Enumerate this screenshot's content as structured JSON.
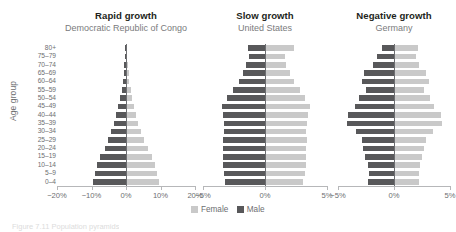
{
  "axis": {
    "y_label": "Age group",
    "age_groups": [
      "80+",
      "75–79",
      "70–74",
      "65–69",
      "60–64",
      "55–59",
      "50–54",
      "45–49",
      "40–44",
      "35–39",
      "30–34",
      "25–29",
      "20–24",
      "15–19",
      "10–14",
      "5–9",
      "0–4"
    ]
  },
  "legend": {
    "female_label": "Female",
    "male_label": "Male",
    "female_color": "#c9c9c9",
    "male_color": "#58585a"
  },
  "caption": {
    "text": "Figure 7.11 Population pyramids"
  },
  "panels": [
    {
      "title": "Rapid growth",
      "subtitle": "Democratic Republic of Congo",
      "ticks": [
        "−20%",
        "−10%",
        "0%",
        "10%",
        "20%"
      ]
    },
    {
      "title": "Slow growth",
      "subtitle": "United States",
      "ticks": [
        "−5%",
        "0%",
        "5%"
      ]
    },
    {
      "title": "Negative growth",
      "subtitle": "Germany",
      "ticks": [
        "−5%",
        "0%",
        "5%"
      ]
    }
  ],
  "chart_data": {
    "type": "bar",
    "title": "Population pyramids",
    "xlabel": "Percent of population",
    "ylabel": "Age group",
    "grid": false,
    "legend_position": "bottom-center",
    "categories": [
      "80+",
      "75–79",
      "70–74",
      "65–69",
      "60–64",
      "55–59",
      "50–54",
      "45–49",
      "40–44",
      "35–39",
      "30–34",
      "25–29",
      "20–24",
      "15–19",
      "10–14",
      "5–9",
      "0–4"
    ],
    "panels": [
      {
        "name": "Rapid growth",
        "subtitle": "Democratic Republic of Congo",
        "xlim": [
          -20,
          20
        ],
        "xticks": [
          -20,
          -10,
          0,
          10,
          20
        ],
        "series": [
          {
            "name": "Male",
            "values": [
              0.25,
              0.35,
              0.5,
              0.7,
              0.95,
              1.3,
              1.7,
              2.2,
              2.8,
              3.5,
              4.3,
              5.2,
              6.2,
              7.4,
              8.4,
              9.0,
              9.6
            ]
          },
          {
            "name": "Female",
            "values": [
              0.3,
              0.4,
              0.55,
              0.75,
              1.0,
              1.35,
              1.75,
              2.25,
              2.85,
              3.55,
              4.35,
              5.3,
              6.3,
              7.5,
              8.5,
              9.1,
              9.7
            ]
          }
        ]
      },
      {
        "name": "Slow growth",
        "subtitle": "United States",
        "xlim": [
          -5,
          5
        ],
        "xticks": [
          -5,
          0,
          5
        ],
        "series": [
          {
            "name": "Male",
            "values": [
              1.4,
              1.3,
              1.5,
              1.8,
              2.1,
              2.6,
              3.1,
              3.5,
              3.4,
              3.3,
              3.3,
              3.4,
              3.4,
              3.4,
              3.4,
              3.3,
              3.2
            ]
          },
          {
            "name": "Female",
            "values": [
              2.3,
              1.6,
              1.7,
              2.0,
              2.3,
              2.8,
              3.2,
              3.6,
              3.5,
              3.4,
              3.3,
              3.4,
              3.3,
              3.3,
              3.3,
              3.2,
              3.1
            ]
          }
        ]
      },
      {
        "name": "Negative growth",
        "subtitle": "Germany",
        "xlim": [
          -5,
          5
        ],
        "xticks": [
          -5,
          0,
          5
        ],
        "series": [
          {
            "name": "Male",
            "values": [
              1.1,
              1.5,
              1.9,
              2.7,
              2.9,
              2.5,
              3.1,
              3.5,
              4.1,
              4.2,
              3.4,
              2.9,
              2.8,
              2.6,
              2.3,
              2.2,
              2.3
            ]
          },
          {
            "name": "Female",
            "values": [
              2.1,
              2.0,
              2.2,
              2.9,
              3.1,
              2.7,
              3.2,
              3.6,
              4.2,
              4.3,
              3.5,
              2.9,
              2.7,
              2.5,
              2.3,
              2.2,
              2.2
            ]
          }
        ]
      }
    ]
  }
}
